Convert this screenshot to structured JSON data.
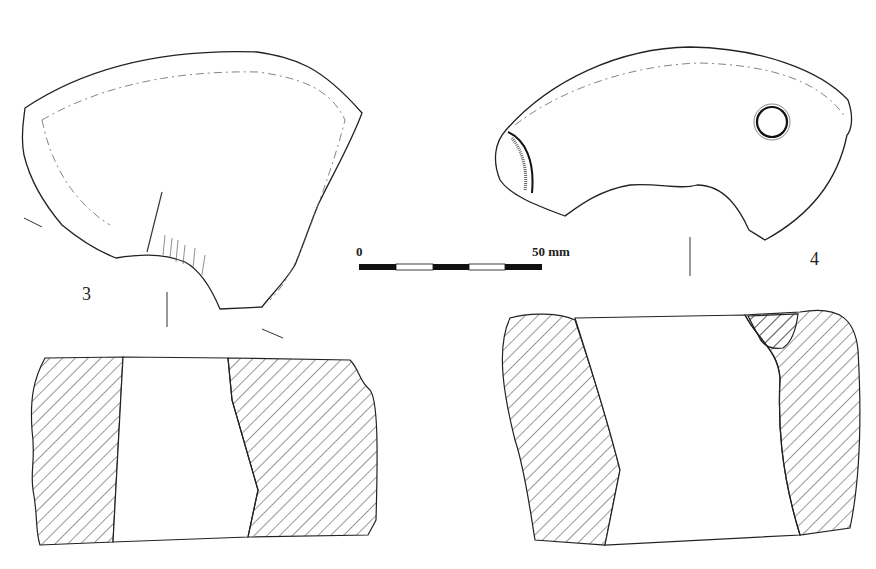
{
  "figures": [
    {
      "number": "3",
      "views": [
        "plan",
        "section"
      ]
    },
    {
      "number": "4",
      "views": [
        "plan",
        "section"
      ]
    }
  ],
  "scale_bar": {
    "start_label": "0",
    "end_label": "50 mm",
    "segments": 5,
    "colors": [
      "#111111",
      "#ffffff",
      "#111111",
      "#ffffff",
      "#111111"
    ]
  },
  "style": {
    "line_color": "#222222",
    "hatch_color": "#333333",
    "background": "#ffffff"
  }
}
